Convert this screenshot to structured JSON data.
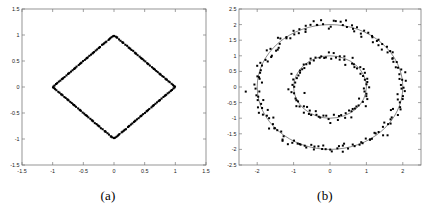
{
  "figure": {
    "background": "#ffffff",
    "point_color": "#000000",
    "curve_color": "#4a4a4a",
    "axis_color": "#7a7a7a"
  },
  "panels": [
    {
      "caption": "(a)"
    },
    {
      "caption": "(b)"
    }
  ],
  "chart_data": [
    {
      "type": "scatter",
      "title": "",
      "subtitle": "",
      "caption": "(a)",
      "xlabel": "",
      "ylabel": "",
      "xlim": [
        -1.5,
        1.5
      ],
      "ylim": [
        -1.5,
        1.5
      ],
      "xticks": [
        -1.5,
        -1,
        -0.5,
        0,
        0.5,
        1,
        1.5
      ],
      "xticklabels": [
        "-1.5",
        "-1",
        "-0.5",
        "0",
        "0.5",
        "1",
        "1.5"
      ],
      "yticks": [
        -1.5,
        -1,
        -0.5,
        0,
        0.5,
        1,
        1.5
      ],
      "yticklabels": [
        "-1.5",
        "-1",
        "-0.5",
        "0",
        "0.5",
        "1",
        "1.5"
      ],
      "grid": false,
      "legend": null,
      "annotations": [],
      "series": [
        {
          "name": "fitted-curve",
          "kind": "line",
          "description": "diamond (rhombus) closed curve with vertices at (0,1), (1,0), (0,-1), (-1,0)",
          "x": [
            0,
            1,
            0,
            -1,
            0
          ],
          "y": [
            1,
            0,
            -1,
            0,
            1
          ]
        },
        {
          "name": "noisy-samples",
          "kind": "scatter",
          "description": "points scattered about the diamond outline",
          "n_points": 200,
          "noise_sigma": 0.06,
          "x": [
            0.0,
            -0.088,
            0.106,
            -0.195,
            0.214,
            -0.299,
            0.313,
            -0.402,
            0.418,
            -0.505,
            0.511,
            -0.611,
            0.619,
            -0.701,
            0.713,
            -0.806,
            0.809,
            -0.9,
            0.908,
            -0.985,
            0.995,
            -0.06,
            0.052,
            -0.16,
            0.151,
            -0.249,
            0.266,
            -0.35,
            0.362,
            -0.452,
            0.465,
            -0.556,
            0.56,
            -0.65,
            0.668,
            -0.749,
            0.762,
            -0.851,
            0.862,
            -0.945,
            0.96,
            -0.018,
            0.028,
            -0.125,
            0.135,
            -0.228,
            0.238,
            -0.325,
            0.34,
            -0.428,
            0.438,
            -0.53,
            0.54,
            -0.63,
            0.64,
            -0.728,
            0.74,
            -0.828,
            0.838,
            -0.925,
            0.94,
            -0.075,
            0.082,
            -0.175,
            0.185,
            -0.275,
            0.285,
            -0.375,
            0.385,
            -0.475,
            0.485,
            -0.575,
            0.585,
            -0.675,
            0.69,
            -0.775,
            0.788,
            -0.875,
            0.888,
            -0.968,
            0.975,
            -0.04,
            0.045,
            -0.14,
            0.145,
            -0.24,
            0.25,
            -0.34,
            0.352,
            -0.44,
            0.452,
            -0.54,
            0.552,
            -0.64,
            0.652,
            -0.74,
            0.752,
            -0.84,
            0.852,
            -0.94
          ],
          "y": [
            0.982,
            0.905,
            0.889,
            0.812,
            0.793,
            0.701,
            0.695,
            0.6,
            0.584,
            0.498,
            0.492,
            0.392,
            0.381,
            0.296,
            0.286,
            0.192,
            0.193,
            0.104,
            0.093,
            0.012,
            0.008,
            0.939,
            0.952,
            0.841,
            0.85,
            0.748,
            0.736,
            0.645,
            0.64,
            0.546,
            0.538,
            0.445,
            0.438,
            0.347,
            0.334,
            0.252,
            0.236,
            0.15,
            0.14,
            0.057,
            0.041,
            0.975,
            0.968,
            0.872,
            0.862,
            0.77,
            0.76,
            0.672,
            0.66,
            0.568,
            0.56,
            0.47,
            0.458,
            0.368,
            0.36,
            0.272,
            0.258,
            0.17,
            0.16,
            0.078,
            0.062,
            0.922,
            0.915,
            0.822,
            0.812,
            0.722,
            0.712,
            0.622,
            0.612,
            0.522,
            0.512,
            0.422,
            0.412,
            0.322,
            0.308,
            0.222,
            0.21,
            0.122,
            0.11,
            0.03,
            0.022,
            0.958,
            0.952,
            0.858,
            0.852,
            0.758,
            0.748,
            0.658,
            0.646,
            0.558,
            0.546,
            0.458,
            0.446,
            0.358,
            0.346,
            0.258,
            0.246,
            0.158,
            0.146,
            0.058
          ]
        }
      ]
    },
    {
      "type": "scatter",
      "title": "",
      "subtitle": "",
      "caption": "(b)",
      "xlabel": "",
      "ylabel": "",
      "xlim": [
        -2.5,
        2.5
      ],
      "ylim": [
        -2.5,
        2.5
      ],
      "xticks": [
        -2,
        -1,
        0,
        1,
        2
      ],
      "xticklabels": [
        "-2",
        "-1",
        "0",
        "1",
        "2"
      ],
      "yticks": [
        -2.5,
        -2,
        -1.5,
        -1,
        -0.5,
        0,
        0.5,
        1,
        1.5,
        2,
        2.5
      ],
      "yticklabels": [
        "-2.5",
        "-2",
        "-1.5",
        "-1",
        "-0.5",
        "0",
        "0.5",
        "1",
        "1.5",
        "2",
        "2.5"
      ],
      "grid": false,
      "legend": null,
      "annotations": [],
      "series": [
        {
          "name": "outer-circle-curve",
          "kind": "line",
          "description": "fitted circle of radius 2 centred at origin",
          "center": [
            0,
            0
          ],
          "radius": 2
        },
        {
          "name": "inner-circle-curve",
          "kind": "line",
          "description": "fitted circle of radius 1 centred at origin",
          "center": [
            0,
            0
          ],
          "radius": 1
        },
        {
          "name": "outer-noisy-samples",
          "kind": "scatter",
          "description": "points scattered about the radius-2 circle",
          "n_points": 160,
          "radius": 2,
          "noise_sigma": 0.09
        },
        {
          "name": "inner-noisy-samples",
          "kind": "scatter",
          "description": "points scattered about the radius-1 circle",
          "n_points": 90,
          "radius": 1,
          "noise_sigma": 0.07
        }
      ]
    }
  ]
}
